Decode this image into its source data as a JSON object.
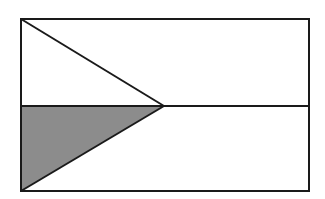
{
  "diagram": {
    "colors": {
      "background": "#ffffff",
      "stroke": "#1a1a1a",
      "shade": "#8c8c8c"
    },
    "rectangle": {
      "x": 21,
      "y": 19,
      "width": 288,
      "height": 172
    },
    "midline_y": 106,
    "triangle_apex": {
      "x": 164,
      "y": 106
    }
  }
}
